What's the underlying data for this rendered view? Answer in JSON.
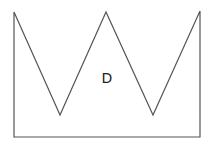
{
  "diagram": {
    "shape": {
      "type": "polygon",
      "description": "crown-shaped polygon with three peaks and two valleys",
      "points": [
        [
          14,
          12
        ],
        [
          60,
          115
        ],
        [
          106,
          12
        ],
        [
          153,
          115
        ],
        [
          200,
          11
        ],
        [
          200,
          137
        ],
        [
          14,
          137
        ]
      ],
      "stroke": "#555555",
      "fill": "#ffffff",
      "label": "D"
    }
  }
}
